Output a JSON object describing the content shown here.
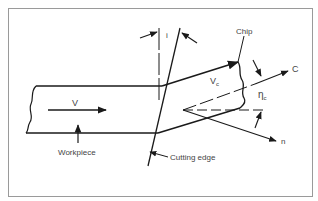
{
  "diagram": {
    "labels": {
      "chip": "Chip",
      "c_axis": "C",
      "vc": "V",
      "vc_sub": "c",
      "eta": "η",
      "eta_sub": "c",
      "v": "V",
      "n_axis": "n",
      "workpiece": "Workpiece",
      "cutting_edge": "Cutting edge",
      "inclination": "i"
    },
    "colors": {
      "line": "#1a1a1a",
      "text": "#444444",
      "frame": "#9a9a9a",
      "background": "#ffffff"
    }
  }
}
